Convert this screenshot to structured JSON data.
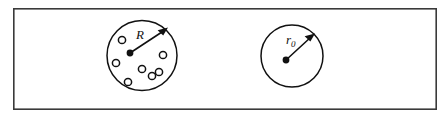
{
  "figure": {
    "frame": {
      "name": "outer-frame",
      "x": 13,
      "y": 8,
      "width": 424,
      "height": 102,
      "stroke_color": "#3a3a3a",
      "fill_color": "#ffffff"
    },
    "background_color": "#ffffff",
    "line_color": "#111111",
    "diagrams": [
      {
        "id": "left",
        "name": "porous-sphere",
        "circle": {
          "cx": 142,
          "cy": 55.5,
          "r": 35
        },
        "center_dot": {
          "cx": 130,
          "cy": 53,
          "r": 3.4
        },
        "radius_label": {
          "text": "R",
          "subscript": "",
          "x": 139,
          "y": 37
        },
        "arrow": {
          "x1": 130,
          "y1": 53,
          "x2": 166,
          "y2": 29
        },
        "particles": [
          {
            "cx": 122,
            "cy": 40,
            "r": 3.6
          },
          {
            "cx": 163,
            "cy": 55,
            "r": 3.6
          },
          {
            "cx": 116,
            "cy": 63,
            "r": 3.6
          },
          {
            "cx": 142,
            "cy": 69,
            "r": 3.6
          },
          {
            "cx": 152,
            "cy": 76,
            "r": 3.6
          },
          {
            "cx": 159,
            "cy": 72,
            "r": 3.6
          },
          {
            "cx": 128,
            "cy": 82,
            "r": 3.6
          }
        ]
      },
      {
        "id": "right",
        "name": "solid-sphere",
        "circle": {
          "cx": 292,
          "cy": 56,
          "r": 31
        },
        "center_dot": {
          "cx": 286,
          "cy": 60,
          "r": 3.4
        },
        "radius_label": {
          "text": "r",
          "subscript": "0",
          "x": 288,
          "y": 42
        },
        "arrow": {
          "x1": 286,
          "y1": 60,
          "x2": 313,
          "y2": 35
        },
        "particles": []
      }
    ]
  }
}
